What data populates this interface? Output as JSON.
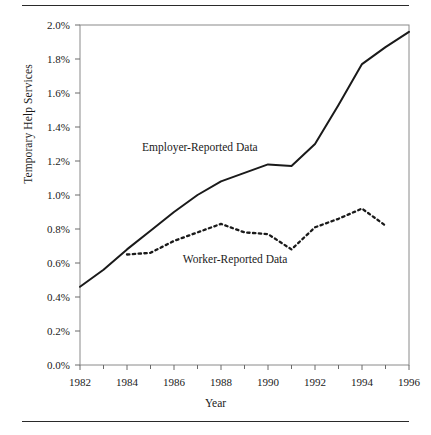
{
  "figure": {
    "y_axis_title": "Temporary Help Services",
    "x_axis_title": "Year"
  },
  "series_labels": {
    "employer": "Employer-Reported Data",
    "worker": "Worker-Reported Data"
  },
  "chart_data": {
    "type": "line",
    "title": "",
    "xlabel": "Year",
    "ylabel": "Temporary Help Services",
    "xlim": [
      1982,
      1996
    ],
    "ylim": [
      0.0,
      2.0
    ],
    "y_unit": "%",
    "grid": false,
    "legend_position": "inline-annotation",
    "y_ticks": [
      0.0,
      0.2,
      0.4,
      0.6,
      0.8,
      1.0,
      1.2,
      1.4,
      1.6,
      1.8,
      2.0
    ],
    "y_tick_labels": [
      "0.0%",
      "0.2%",
      "0.4%",
      "0.6%",
      "0.8%",
      "1.0%",
      "1.2%",
      "1.4%",
      "1.6%",
      "1.8%",
      "2.0%"
    ],
    "x_ticks": [
      1982,
      1984,
      1986,
      1988,
      1990,
      1992,
      1994,
      1996
    ],
    "x_tick_labels": [
      "1982",
      "1984",
      "1986",
      "1988",
      "1990",
      "1992",
      "1994",
      "1996"
    ],
    "x_minor_ticks": [
      1983,
      1985,
      1987,
      1989,
      1991,
      1993,
      1995
    ],
    "series": [
      {
        "name": "Employer-Reported Data",
        "style": "solid",
        "color": "#1a1a1a",
        "x": [
          1982,
          1983,
          1984,
          1985,
          1986,
          1987,
          1988,
          1989,
          1990,
          1991,
          1992,
          1993,
          1994,
          1995,
          1996
        ],
        "values": [
          0.46,
          0.56,
          0.68,
          0.79,
          0.9,
          1.0,
          1.08,
          1.13,
          1.18,
          1.17,
          1.3,
          1.53,
          1.77,
          1.87,
          1.96
        ]
      },
      {
        "name": "Worker-Reported Data",
        "style": "dotted",
        "color": "#1a1a1a",
        "x": [
          1984,
          1985,
          1986,
          1987,
          1988,
          1989,
          1990,
          1991,
          1992,
          1993,
          1994,
          1995
        ],
        "values": [
          0.65,
          0.66,
          0.73,
          0.78,
          0.83,
          0.78,
          0.77,
          0.68,
          0.81,
          0.86,
          0.92,
          0.82
        ]
      }
    ],
    "annotations": [
      {
        "text": "Employer-Reported Data",
        "x": 1987.1,
        "y": 1.26
      },
      {
        "text": "Worker-Reported Data",
        "x": 1988.6,
        "y": 0.6
      }
    ]
  }
}
